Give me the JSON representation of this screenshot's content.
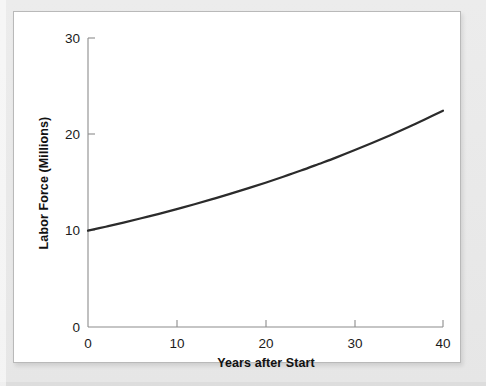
{
  "figure": {
    "background_color": "#e9e9e9",
    "card_color": "#ffffff",
    "border_color": "#b9b9b9"
  },
  "chart_data": {
    "type": "line",
    "title": "",
    "xlabel": "Years after Start",
    "ylabel": "Labor Force (Millions)",
    "xlim": [
      0,
      40
    ],
    "ylim": [
      0,
      30
    ],
    "xticks": [
      0,
      10,
      20,
      30,
      40
    ],
    "yticks": [
      0,
      10,
      20,
      30
    ],
    "xtick_labels": [
      "0",
      "10",
      "20",
      "30",
      "40"
    ],
    "ytick_labels": [
      "0",
      "10",
      "20",
      "30"
    ],
    "grid": false,
    "legend": false,
    "series": [
      {
        "name": "Labor Force",
        "color": "#2b2b2b",
        "x": [
          0,
          2,
          4,
          6,
          8,
          10,
          12,
          14,
          16,
          18,
          20,
          22,
          24,
          26,
          28,
          30,
          32,
          34,
          36,
          38,
          40
        ],
        "values": [
          10.0,
          10.41,
          10.84,
          11.29,
          11.75,
          12.24,
          12.74,
          13.27,
          13.82,
          14.39,
          14.98,
          15.6,
          16.24,
          16.92,
          17.61,
          18.34,
          19.1,
          19.89,
          20.71,
          21.57,
          22.46
        ]
      }
    ],
    "annotations": []
  },
  "axes": {
    "x_axis_name": "x-axis",
    "y_axis_name": "y-axis",
    "tick_direction": "inward"
  }
}
